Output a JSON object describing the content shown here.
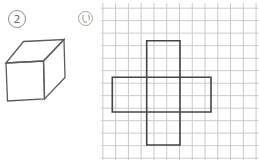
{
  "problem": {
    "number": "2"
  },
  "option": {
    "label": "い"
  },
  "colors": {
    "background": "#ffffff",
    "figure_line": "#5c5c5c",
    "net_line": "#454545",
    "grid_line": "#cdc9c5",
    "badge_line": "#8f8f8f",
    "badge_text": "#6f6f6f",
    "option_line": "#a8a29c"
  },
  "grid": {
    "cell_width": 12.78,
    "cell_height": 12.5,
    "offset_x": 1.4,
    "offset_y": 4.7
  },
  "cube": {
    "front_points": "6,63 43.5,61 44.5,99 7.5,101",
    "top_points": "6,63 23.5,41.5 64,39.5 43.5,61",
    "right_points": "43.5,61 64,39.5 65,77.5 44.5,99"
  },
  "net": {
    "vertical_rect_points": "146.7,40.7 180,40.7 180,145 146.7,145",
    "horizontal_rect_points": "112.3,77.3 211,77.3 211,112 112.3,112"
  },
  "option_glyph": {
    "left_stroke": "M 83.2,15.3 C 82.4,17.6 82.6,20.2 84.6,22.2 C 85.3,22.8 86.1,22.4 86.3,21.3",
    "right_stroke": "M 88.6,15.0 C 89.3,16.4 89.5,18.2 89.2,19.8"
  }
}
